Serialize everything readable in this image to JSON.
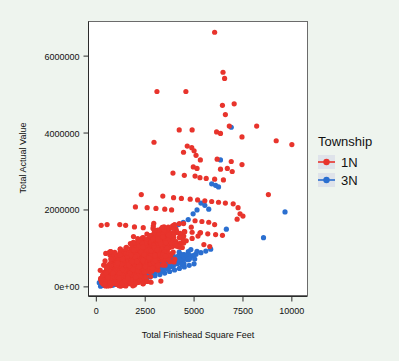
{
  "chart_data": {
    "type": "scatter",
    "title": "",
    "xlabel": "Total Finishead Square Feet",
    "ylabel": "Total Actual Value",
    "xlim": [
      -400,
      10800
    ],
    "ylim": [
      -250000,
      6900000
    ],
    "xticks": [
      0,
      2500,
      5000,
      7500,
      10000
    ],
    "xtick_labels": [
      "0",
      "2500",
      "5000",
      "7500",
      "10000"
    ],
    "yticks": [
      0,
      2000000,
      4000000,
      6000000
    ],
    "ytick_labels": [
      "0e+00",
      "2000000",
      "4000000",
      "6000000"
    ],
    "grid": false,
    "legend": {
      "title": "Township",
      "position": "right",
      "entries": [
        {
          "label": "1N",
          "color": "#e8342c",
          "marker": "circle-with-line"
        },
        {
          "label": "3N",
          "color": "#2b6fd0",
          "marker": "circle-with-line"
        }
      ]
    },
    "series": [
      {
        "name": "1N",
        "color": "#e8342c",
        "point_count": 1400,
        "trend_line": {
          "x": [
            300,
            10100
          ],
          "y": [
            130000,
            3100000
          ],
          "color": "#e8342c"
        },
        "points": [
          [
            6050,
            6620
          ],
          [
            6480,
            5580
          ],
          [
            6560,
            5420
          ],
          [
            3100,
            5080
          ],
          [
            4580,
            5080
          ],
          [
            6450,
            4720
          ],
          [
            7050,
            4760
          ],
          [
            6600,
            4480
          ],
          [
            6800,
            4180
          ],
          [
            8200,
            4180
          ],
          [
            4240,
            4080
          ],
          [
            4900,
            4080
          ],
          [
            6150,
            4030
          ],
          [
            6350,
            3990
          ],
          [
            7450,
            3900
          ],
          [
            2950,
            3760
          ],
          [
            9200,
            3800
          ],
          [
            10000,
            3700
          ],
          [
            4650,
            3660
          ],
          [
            4880,
            3620
          ],
          [
            5000,
            3540
          ],
          [
            4460,
            3500
          ],
          [
            5100,
            3420
          ],
          [
            5320,
            3300
          ],
          [
            6180,
            3320
          ],
          [
            6900,
            3260
          ],
          [
            7450,
            3180
          ],
          [
            4960,
            3120
          ],
          [
            5150,
            3080
          ],
          [
            6350,
            3060
          ],
          [
            6700,
            3080
          ],
          [
            6950,
            3000
          ],
          [
            3920,
            2960
          ],
          [
            4500,
            2900
          ],
          [
            5050,
            2880
          ],
          [
            5300,
            2840
          ],
          [
            5620,
            2820
          ],
          [
            6050,
            2800
          ],
          [
            6500,
            2780
          ],
          [
            8800,
            2400
          ],
          [
            2300,
            2400
          ],
          [
            3400,
            2360
          ],
          [
            3950,
            2320
          ],
          [
            4350,
            2300
          ],
          [
            4800,
            2280
          ],
          [
            5180,
            2260
          ],
          [
            5550,
            2240
          ],
          [
            5900,
            2220
          ],
          [
            6250,
            2200
          ],
          [
            6600,
            2180
          ],
          [
            7000,
            2160
          ],
          [
            7250,
            2060
          ],
          [
            7350,
            1900
          ],
          [
            7500,
            1840
          ],
          [
            7200,
            1760
          ],
          [
            2000,
            2080
          ],
          [
            2600,
            2060
          ],
          [
            3050,
            2040
          ],
          [
            3500,
            2020
          ],
          [
            3850,
            2000
          ],
          [
            1200,
            1620
          ],
          [
            1500,
            1600
          ],
          [
            550,
            1620
          ],
          [
            250,
            1600
          ],
          [
            1950,
            1560
          ],
          [
            2400,
            1540
          ],
          [
            2900,
            1520
          ],
          [
            3300,
            1500
          ],
          [
            3700,
            1480
          ],
          [
            4100,
            1460
          ],
          [
            4500,
            1440
          ],
          [
            4900,
            1420
          ],
          [
            5300,
            1400
          ],
          [
            5700,
            1380
          ],
          [
            6100,
            1360
          ],
          [
            6450,
            1340
          ],
          [
            6050,
            1620
          ],
          [
            5750,
            1680
          ],
          [
            5400,
            1700
          ],
          [
            5050,
            1720
          ],
          [
            200,
            430
          ],
          [
            400,
            380
          ],
          [
            700,
            420
          ],
          [
            1000,
            480
          ],
          [
            1300,
            540
          ],
          [
            1600,
            600
          ],
          [
            1900,
            660
          ],
          [
            2200,
            720
          ],
          [
            2500,
            780
          ],
          [
            2800,
            840
          ],
          [
            3100,
            900
          ],
          [
            3400,
            960
          ],
          [
            3700,
            1020
          ],
          [
            4000,
            1080
          ],
          [
            4300,
            1140
          ],
          [
            4600,
            1200
          ],
          [
            4900,
            1260
          ],
          [
            5200,
            1320
          ],
          [
            5500,
            1100
          ],
          [
            5800,
            1050
          ],
          [
            300,
            120
          ],
          [
            600,
            160
          ],
          [
            900,
            200
          ],
          [
            1200,
            240
          ],
          [
            1500,
            280
          ],
          [
            1800,
            320
          ],
          [
            2100,
            360
          ],
          [
            2400,
            400
          ],
          [
            2700,
            440
          ],
          [
            3000,
            480
          ],
          [
            3300,
            150
          ],
          [
            2800,
            120
          ],
          [
            2400,
            100
          ],
          [
            2000,
            90
          ],
          [
            1600,
            80
          ]
        ]
      },
      {
        "name": "3N",
        "color": "#2b6fd0",
        "point_count": 700,
        "trend_line": {
          "x": [
            5700,
            9900
          ],
          "y": [
            950000,
            1720000
          ],
          "color": "#2b6fd0"
        },
        "points": [
          [
            6900,
            4150
          ],
          [
            6350,
            3300
          ],
          [
            5900,
            2680
          ],
          [
            6100,
            2640
          ],
          [
            6250,
            2600
          ],
          [
            9650,
            1950
          ],
          [
            8550,
            1280
          ],
          [
            6650,
            1500
          ],
          [
            5750,
            2020
          ],
          [
            5550,
            2120
          ],
          [
            5350,
            2180
          ],
          [
            5150,
            2000
          ],
          [
            4950,
            1900
          ],
          [
            4700,
            1750
          ],
          [
            4450,
            1680
          ],
          [
            4200,
            1620
          ],
          [
            3950,
            1560
          ],
          [
            3700,
            1480
          ],
          [
            3450,
            1420
          ],
          [
            3200,
            1360
          ],
          [
            2950,
            1300
          ],
          [
            2700,
            1240
          ],
          [
            2450,
            1180
          ],
          [
            2200,
            1120
          ],
          [
            1950,
            1060
          ],
          [
            5850,
            980
          ],
          [
            5600,
            930
          ],
          [
            5350,
            890
          ],
          [
            5100,
            850
          ],
          [
            4850,
            810
          ],
          [
            4600,
            770
          ],
          [
            4350,
            730
          ],
          [
            4100,
            690
          ],
          [
            3850,
            650
          ],
          [
            3600,
            610
          ],
          [
            3350,
            570
          ],
          [
            3100,
            530
          ],
          [
            2850,
            490
          ],
          [
            2600,
            450
          ],
          [
            2350,
            410
          ],
          [
            2100,
            370
          ],
          [
            1850,
            330
          ],
          [
            1600,
            300
          ],
          [
            1350,
            270
          ],
          [
            1100,
            240
          ],
          [
            850,
            210
          ],
          [
            600,
            180
          ],
          [
            400,
            150
          ],
          [
            250,
            130
          ],
          [
            150,
            110
          ],
          [
            5000,
            600
          ],
          [
            4750,
            560
          ],
          [
            4500,
            520
          ],
          [
            4250,
            480
          ],
          [
            4000,
            440
          ],
          [
            3750,
            400
          ],
          [
            3500,
            360
          ],
          [
            3250,
            320
          ],
          [
            3000,
            290
          ],
          [
            2750,
            260
          ],
          [
            2500,
            230
          ],
          [
            2250,
            200
          ],
          [
            2000,
            180
          ],
          [
            1750,
            160
          ],
          [
            1500,
            140
          ],
          [
            1250,
            120
          ],
          [
            1000,
            105
          ],
          [
            750,
            95
          ],
          [
            500,
            85
          ],
          [
            300,
            75
          ]
        ]
      }
    ]
  },
  "axes": {
    "x_title": "Total Finishead Square Feet",
    "y_title": "Total Actual Value",
    "x_tick_labels": [
      "0",
      "2500",
      "5000",
      "7500",
      "10000"
    ],
    "y_tick_labels": [
      "0e+00",
      "2000000",
      "4000000",
      "6000000"
    ]
  },
  "legend": {
    "title": "Township",
    "item_1_label": "1N",
    "item_2_label": "3N"
  },
  "colors": {
    "series_1N": "#e8342c",
    "series_3N": "#2b6fd0",
    "panel_background": "#ffffff",
    "page_background": "#eef4ee",
    "axis": "#2b2b2b",
    "legend_key_background": "#dfe3ea"
  }
}
